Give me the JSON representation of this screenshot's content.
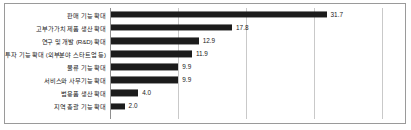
{
  "chart_data": {
    "type": "bar",
    "orientation": "horizontal",
    "title": "",
    "subtitle": "",
    "xlabel": "",
    "ylabel": "",
    "xlim": [
      0,
      40
    ],
    "gridlines": [
      10,
      20,
      30,
      40
    ],
    "grid": true,
    "legend": false,
    "bar_color": "#1c1c1c",
    "categories": [
      "판매 기능 확대",
      "고부가가치 제품 생산 확대",
      "연구 및 개발 (R&D) 확대",
      "투자 기능 확대 (외부분야 스타트업 등)",
      "물류 기능 확대",
      "서비스와 사무기능 확대",
      "범용품 생산 확대",
      "지역 총괄 기능 확대"
    ],
    "values": [
      31.7,
      17.8,
      12.9,
      11.9,
      9.9,
      9.9,
      4.0,
      2.0
    ],
    "value_labels": [
      "31.7",
      "17.8",
      "12.9",
      "11.9",
      "9.9",
      "9.9",
      "4.0",
      "2.0"
    ]
  },
  "colors": {
    "bar": "#1c1c1c",
    "grid": "#c9c9c9",
    "border": "#9a9a9a",
    "text": "#1a1a1a",
    "background": "#ffffff"
  }
}
